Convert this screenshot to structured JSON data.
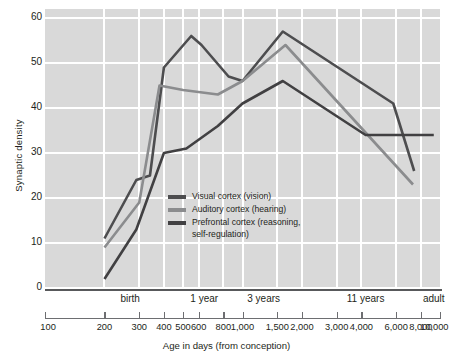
{
  "chart_data": {
    "type": "line",
    "title": "",
    "xlabel": "Age in days (from conception)",
    "ylabel": "Synaptic density",
    "xscale": "log",
    "xlim": [
      100,
      10000
    ],
    "ylim": [
      0,
      62
    ],
    "grid": true,
    "legend_position": "inside-center-left",
    "y_ticks": [
      0,
      10,
      20,
      30,
      40,
      50,
      60
    ],
    "x_ticks": [
      100,
      200,
      300,
      400,
      500,
      600,
      800,
      1000,
      1500,
      2000,
      3000,
      4000,
      6000,
      8000,
      10000
    ],
    "x_tick_labels": [
      "100",
      "200",
      "300",
      "400",
      "500",
      "600",
      "800",
      "1,000",
      "1,500",
      "2,000",
      "3,000",
      "4,000",
      "6,000",
      "8,000",
      "10,000"
    ],
    "stage_labels": [
      {
        "label": "birth",
        "x": 270
      },
      {
        "label": "1 year",
        "x": 640
      },
      {
        "label": "3 years",
        "x": 1280
      },
      {
        "label": "11 years",
        "x": 4200
      },
      {
        "label": "adult",
        "x": 9300
      }
    ],
    "series": [
      {
        "name": "Visual cortex (vision)",
        "color": "#4d4d4f",
        "points": [
          {
            "x": 200,
            "y": 11
          },
          {
            "x": 290,
            "y": 24
          },
          {
            "x": 340,
            "y": 25
          },
          {
            "x": 400,
            "y": 49
          },
          {
            "x": 550,
            "y": 56
          },
          {
            "x": 620,
            "y": 54
          },
          {
            "x": 850,
            "y": 47
          },
          {
            "x": 1000,
            "y": 46
          },
          {
            "x": 1600,
            "y": 57
          },
          {
            "x": 5800,
            "y": 41
          },
          {
            "x": 7400,
            "y": 26
          }
        ]
      },
      {
        "name": "Auditory cortex (hearing)",
        "color": "#8b8c8e",
        "points": [
          {
            "x": 200,
            "y": 9
          },
          {
            "x": 300,
            "y": 19
          },
          {
            "x": 380,
            "y": 45
          },
          {
            "x": 500,
            "y": 44
          },
          {
            "x": 750,
            "y": 43
          },
          {
            "x": 1000,
            "y": 46
          },
          {
            "x": 1650,
            "y": 54
          },
          {
            "x": 7300,
            "y": 23
          }
        ]
      },
      {
        "name": "Prefrontal cortex (reasoning,\nself-regulation)",
        "color": "#414042",
        "points": [
          {
            "x": 200,
            "y": 2
          },
          {
            "x": 290,
            "y": 13
          },
          {
            "x": 400,
            "y": 30
          },
          {
            "x": 520,
            "y": 31
          },
          {
            "x": 750,
            "y": 36
          },
          {
            "x": 1000,
            "y": 41
          },
          {
            "x": 1600,
            "y": 46
          },
          {
            "x": 4200,
            "y": 34
          },
          {
            "x": 9300,
            "y": 34
          }
        ]
      }
    ]
  },
  "legend": {
    "items": [
      {
        "label": "Visual cortex (vision)",
        "color": "#4d4d4f"
      },
      {
        "label": "Auditory cortex (hearing)",
        "color": "#8b8c8e"
      },
      {
        "label": "Prefrontal cortex (reasoning,\nself-regulation)",
        "color": "#414042"
      }
    ]
  },
  "axes": {
    "y_title": "Synaptic density",
    "x_title": "Age in days (from conception)"
  },
  "colors": {
    "plot_background": "#d9d9d9",
    "gridline": "#ffffff",
    "axis": "#58595b",
    "text": "#231f20"
  }
}
